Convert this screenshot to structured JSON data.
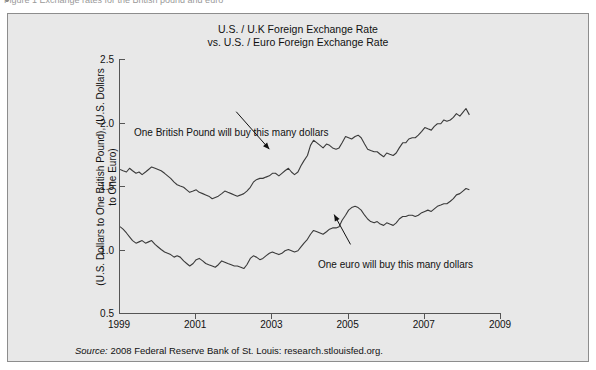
{
  "page": {
    "cut_text": "Figure 1    Exchange rates for the British pound and euro",
    "background_color": "#e8e8e8",
    "line_color": "#3a3a3a",
    "axis_color": "#555555"
  },
  "chart_data": {
    "type": "line",
    "title": "U.S. / U.K Foreign Exchange Rate\nvs. U.S. / Euro Foreign Exchange Rate",
    "xlabel": "",
    "ylabel": "(U.S. Dollars to One British Pound), (U.S. Dollars\nto One Euro)",
    "xlim": [
      1999,
      2009
    ],
    "ylim": [
      0.5,
      2.5
    ],
    "grid": false,
    "legend_position": "none",
    "xticks": [
      "1999",
      "2001",
      "2003",
      "2005",
      "2007",
      "2009"
    ],
    "xtick_values": [
      1999,
      2001,
      2003,
      2005,
      2007,
      2009
    ],
    "yticks": [
      "0.5",
      "1.0",
      "1.5",
      "2.0",
      "2.5"
    ],
    "ytick_values": [
      0.5,
      1.0,
      1.5,
      2.0,
      2.5
    ],
    "annotations": [
      {
        "text": "One British Pound will buy this many dollars",
        "arrow_from": [
          2002.05,
          2.085
        ],
        "arrow_to": [
          2002.92,
          1.79
        ]
      },
      {
        "text": "One euro will buy this many dollars",
        "arrow_from": [
          2005.05,
          1.04
        ],
        "arrow_to": [
          2004.62,
          1.275
        ]
      }
    ],
    "series": [
      {
        "name": "U.S. Dollars to One British Pound",
        "x": [
          1999.0,
          1999.08,
          1999.17,
          1999.25,
          1999.33,
          1999.42,
          1999.5,
          1999.58,
          1999.67,
          1999.75,
          1999.83,
          1999.92,
          2000.0,
          2000.08,
          2000.17,
          2000.25,
          2000.33,
          2000.42,
          2000.5,
          2000.58,
          2000.67,
          2000.75,
          2000.83,
          2000.92,
          2001.0,
          2001.08,
          2001.17,
          2001.25,
          2001.33,
          2001.42,
          2001.5,
          2001.58,
          2001.67,
          2001.75,
          2001.83,
          2001.92,
          2002.0,
          2002.08,
          2002.17,
          2002.25,
          2002.33,
          2002.42,
          2002.5,
          2002.58,
          2002.67,
          2002.75,
          2002.83,
          2002.92,
          2003.0,
          2003.08,
          2003.17,
          2003.25,
          2003.33,
          2003.42,
          2003.5,
          2003.58,
          2003.67,
          2003.75,
          2003.83,
          2003.92,
          2004.0,
          2004.08,
          2004.17,
          2004.25,
          2004.33,
          2004.42,
          2004.5,
          2004.58,
          2004.67,
          2004.75,
          2004.83,
          2004.92,
          2005.0,
          2005.08,
          2005.17,
          2005.25,
          2005.33,
          2005.42,
          2005.5,
          2005.58,
          2005.67,
          2005.75,
          2005.83,
          2005.92,
          2006.0,
          2006.08,
          2006.17,
          2006.25,
          2006.33,
          2006.42,
          2006.5,
          2006.58,
          2006.67,
          2006.75,
          2006.83,
          2006.92,
          2007.0,
          2007.08,
          2007.17,
          2007.25,
          2007.33,
          2007.42,
          2007.5,
          2007.58,
          2007.67,
          2007.75,
          2007.83,
          2007.92,
          2008.0,
          2008.08,
          2008.17
        ],
        "values": [
          1.63,
          1.62,
          1.61,
          1.64,
          1.62,
          1.6,
          1.61,
          1.59,
          1.61,
          1.63,
          1.65,
          1.64,
          1.63,
          1.62,
          1.6,
          1.58,
          1.56,
          1.53,
          1.51,
          1.5,
          1.49,
          1.47,
          1.45,
          1.46,
          1.47,
          1.45,
          1.44,
          1.43,
          1.42,
          1.4,
          1.41,
          1.42,
          1.44,
          1.46,
          1.45,
          1.44,
          1.43,
          1.42,
          1.43,
          1.44,
          1.46,
          1.49,
          1.53,
          1.55,
          1.56,
          1.56,
          1.57,
          1.58,
          1.6,
          1.6,
          1.58,
          1.6,
          1.62,
          1.64,
          1.61,
          1.59,
          1.61,
          1.66,
          1.7,
          1.74,
          1.82,
          1.86,
          1.84,
          1.82,
          1.8,
          1.83,
          1.82,
          1.8,
          1.79,
          1.8,
          1.84,
          1.89,
          1.88,
          1.87,
          1.89,
          1.9,
          1.88,
          1.83,
          1.79,
          1.78,
          1.77,
          1.77,
          1.75,
          1.73,
          1.76,
          1.75,
          1.74,
          1.76,
          1.8,
          1.84,
          1.84,
          1.87,
          1.88,
          1.88,
          1.9,
          1.93,
          1.96,
          1.95,
          1.94,
          1.97,
          1.99,
          1.99,
          2.02,
          2.01,
          2.02,
          2.04,
          2.07,
          2.05,
          2.08,
          2.11,
          2.06
        ]
      },
      {
        "name": "U.S. Dollars to One Euro",
        "x": [
          1999.0,
          1999.08,
          1999.17,
          1999.25,
          1999.33,
          1999.42,
          1999.5,
          1999.58,
          1999.67,
          1999.75,
          1999.83,
          1999.92,
          2000.0,
          2000.08,
          2000.17,
          2000.25,
          2000.33,
          2000.42,
          2000.5,
          2000.58,
          2000.67,
          2000.75,
          2000.83,
          2000.92,
          2001.0,
          2001.08,
          2001.17,
          2001.25,
          2001.33,
          2001.42,
          2001.5,
          2001.58,
          2001.67,
          2001.75,
          2001.83,
          2001.92,
          2002.0,
          2002.08,
          2002.17,
          2002.25,
          2002.33,
          2002.42,
          2002.5,
          2002.58,
          2002.67,
          2002.75,
          2002.83,
          2002.92,
          2003.0,
          2003.08,
          2003.17,
          2003.25,
          2003.33,
          2003.42,
          2003.5,
          2003.58,
          2003.67,
          2003.75,
          2003.83,
          2003.92,
          2004.0,
          2004.08,
          2004.17,
          2004.25,
          2004.33,
          2004.42,
          2004.5,
          2004.58,
          2004.67,
          2004.75,
          2004.83,
          2004.92,
          2005.0,
          2005.08,
          2005.17,
          2005.25,
          2005.33,
          2005.42,
          2005.5,
          2005.58,
          2005.67,
          2005.75,
          2005.83,
          2005.92,
          2006.0,
          2006.08,
          2006.17,
          2006.25,
          2006.33,
          2006.42,
          2006.5,
          2006.58,
          2006.67,
          2006.75,
          2006.83,
          2006.92,
          2007.0,
          2007.08,
          2007.17,
          2007.25,
          2007.33,
          2007.42,
          2007.5,
          2007.58,
          2007.67,
          2007.75,
          2007.83,
          2007.92,
          2008.0,
          2008.08,
          2008.17
        ],
        "values": [
          1.18,
          1.16,
          1.13,
          1.1,
          1.07,
          1.05,
          1.06,
          1.07,
          1.05,
          1.06,
          1.07,
          1.04,
          1.02,
          1.0,
          0.98,
          0.97,
          0.96,
          0.94,
          0.95,
          0.94,
          0.91,
          0.89,
          0.87,
          0.89,
          0.92,
          0.93,
          0.91,
          0.89,
          0.88,
          0.87,
          0.86,
          0.88,
          0.91,
          0.9,
          0.89,
          0.88,
          0.87,
          0.87,
          0.86,
          0.85,
          0.88,
          0.93,
          0.95,
          0.94,
          0.92,
          0.93,
          0.95,
          0.97,
          0.98,
          0.97,
          0.96,
          0.97,
          0.99,
          1.0,
          0.99,
          0.98,
          0.99,
          1.02,
          1.05,
          1.08,
          1.12,
          1.15,
          1.14,
          1.13,
          1.12,
          1.14,
          1.16,
          1.17,
          1.17,
          1.18,
          1.23,
          1.27,
          1.31,
          1.33,
          1.34,
          1.33,
          1.31,
          1.27,
          1.24,
          1.22,
          1.21,
          1.22,
          1.2,
          1.19,
          1.21,
          1.2,
          1.19,
          1.21,
          1.24,
          1.26,
          1.26,
          1.27,
          1.27,
          1.26,
          1.27,
          1.29,
          1.3,
          1.31,
          1.3,
          1.32,
          1.34,
          1.35,
          1.36,
          1.36,
          1.38,
          1.4,
          1.43,
          1.44,
          1.46,
          1.48,
          1.47
        ]
      }
    ]
  },
  "source": {
    "prefix": "Source:",
    "text": "2008 Federal Reserve Bank of St. Louis: research.stlouisfed.org."
  }
}
